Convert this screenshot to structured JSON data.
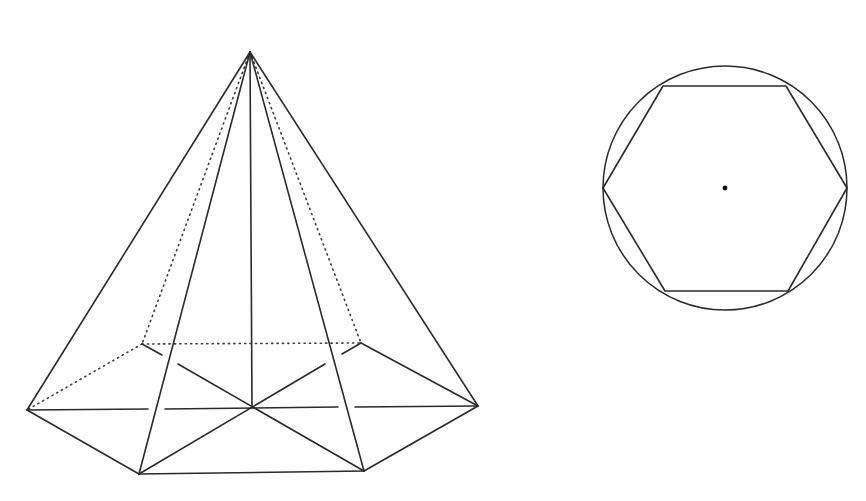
{
  "figure": {
    "background": "#ffffff",
    "line_color": "#2a2a2a",
    "pyramid": {
      "description": "Regular hexagonal pyramid with hidden edges dotted and base diagonals",
      "apex": [
        250,
        52
      ],
      "base_center": [
        252,
        408
      ],
      "base_vertices": {
        "left": [
          27,
          410
        ],
        "front_left": [
          139,
          474
        ],
        "front_right": [
          364,
          471
        ],
        "right": [
          478,
          406
        ],
        "back_right": [
          361,
          343
        ],
        "back_left": [
          142,
          344
        ]
      },
      "visible_lateral_edges": [
        "left",
        "front_left",
        "front_right",
        "right"
      ],
      "hidden_lateral_edges": [
        "back_left",
        "back_right"
      ],
      "height_line": "apex to base_center"
    },
    "hexagon_in_circle": {
      "description": "Regular hexagon inscribed in a circle with center point marked",
      "circle_center": [
        725,
        188
      ],
      "circle_radius": 122,
      "hexagon_vertices": [
        [
          603,
          188
        ],
        [
          663,
          86
        ],
        [
          786,
          86
        ],
        [
          847,
          188
        ],
        [
          788,
          291
        ],
        [
          665,
          291
        ]
      ],
      "center_dot": true
    }
  }
}
